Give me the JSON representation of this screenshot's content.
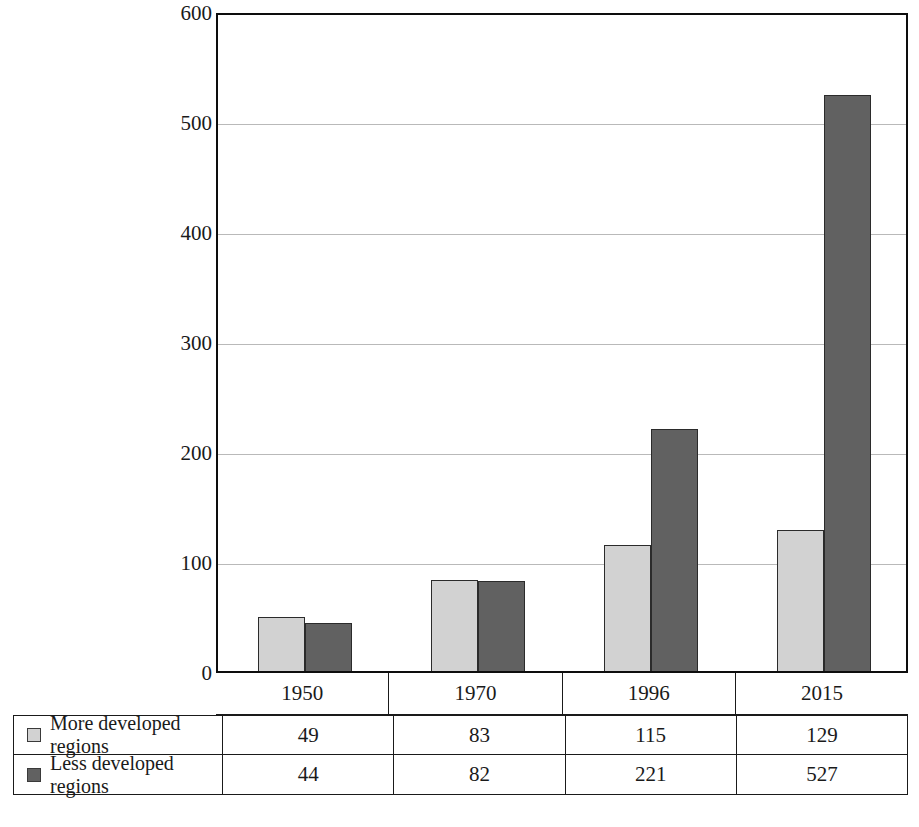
{
  "chart_data": {
    "type": "bar",
    "title": "",
    "xlabel": "",
    "ylabel": "Number with population >1 million",
    "categories": [
      "1950",
      "1970",
      "1996",
      "2015"
    ],
    "series": [
      {
        "name": "More developed regions",
        "values": [
          49,
          83,
          115,
          129
        ],
        "color": "#d2d2d2"
      },
      {
        "name": "Less developed regions",
        "values": [
          44,
          82,
          221,
          527
        ],
        "color": "#616161"
      }
    ],
    "ylim": [
      0,
      600
    ],
    "yticks": [
      0,
      100,
      200,
      300,
      400,
      500,
      600
    ],
    "ytick_labels": [
      "0",
      "100",
      "200",
      "300",
      "400",
      "500",
      "600"
    ],
    "grid": true,
    "legend_position": "bottom-table",
    "bar_mode": "grouped"
  },
  "axis": {
    "y_title": "Number with population >1 million",
    "y_ticks": [
      "600",
      "500",
      "400",
      "300",
      "200",
      "100",
      "0"
    ]
  },
  "year_header": {
    "cells": [
      "1950",
      "1970",
      "1996",
      "2015"
    ]
  },
  "table": {
    "rows": [
      {
        "label": "More developed regions",
        "swatch": "light-gray-swatch-icon",
        "values": [
          "49",
          "83",
          "115",
          "129"
        ]
      },
      {
        "label": "Less developed regions",
        "swatch": "dark-gray-swatch-icon",
        "values": [
          "44",
          "82",
          "221",
          "527"
        ]
      }
    ]
  }
}
